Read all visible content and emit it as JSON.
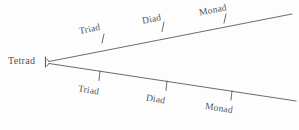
{
  "figure": {
    "kind": "branching-line-diagram",
    "ink_color": "#3a3a38",
    "background_color": "#fdfdfd",
    "root": {
      "label": "Tetrad",
      "bracket_glyph": "|"
    },
    "branches": [
      {
        "name": "upper-branch",
        "ticks": [
          {
            "label": "Triad"
          },
          {
            "label": "Diad"
          },
          {
            "label": "Monad"
          }
        ]
      },
      {
        "name": "lower-branch",
        "ticks": [
          {
            "label": "Triad"
          },
          {
            "label": "Diad"
          },
          {
            "label": "Monad"
          }
        ]
      }
    ]
  }
}
